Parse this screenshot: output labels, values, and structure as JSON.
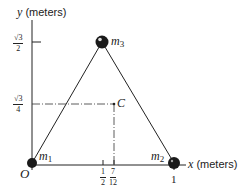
{
  "figure": {
    "y_axis_label": {
      "var": "y",
      "unit": "(meters)"
    },
    "x_axis_label": {
      "var": "x",
      "unit": "(meters)"
    },
    "origin_label": "O",
    "y_ticks": [
      {
        "num": "√3",
        "den": "2",
        "value": 0.866
      },
      {
        "num": "√3",
        "den": "4",
        "value": 0.433
      }
    ],
    "x_ticks": [
      {
        "num": "1",
        "den": "2",
        "value": 0.5
      },
      {
        "num": "7",
        "den": "12",
        "value": 0.5833
      },
      {
        "label": "1",
        "value": 1
      }
    ],
    "masses": [
      {
        "name": "m",
        "sub": "1",
        "x": 0,
        "y": 0
      },
      {
        "name": "m",
        "sub": "2",
        "x": 1,
        "y": 0
      },
      {
        "name": "m",
        "sub": "3",
        "x": 0.5,
        "y": 0.866
      }
    ],
    "center_point": {
      "label": "C",
      "x": 0.5833,
      "y": 0.433
    },
    "colors": {
      "ink": "#222222",
      "mass": "#1a1a1a",
      "background": "#ffffff"
    }
  }
}
